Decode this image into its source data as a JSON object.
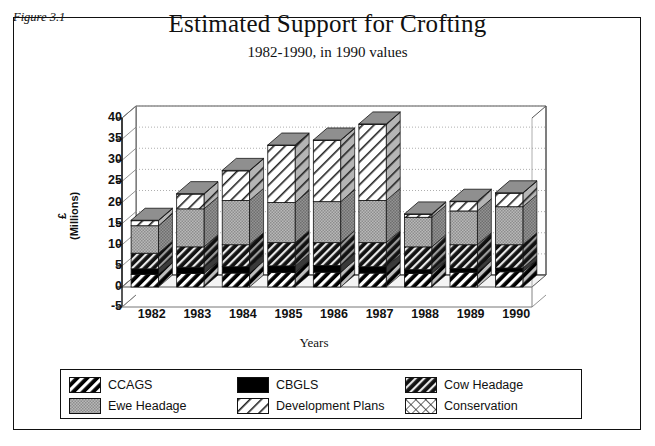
{
  "figure": {
    "label": "Figure 3.1",
    "title": "Estimated Support for Crofting",
    "subtitle": "1982-1990, in 1990 values"
  },
  "chart_data": {
    "type": "bar",
    "stacked": true,
    "three_d": true,
    "title": "Estimated Support for Crofting",
    "subtitle": "1982-1990, in 1990 values",
    "xlabel": "Years",
    "ylabel": "£\n(Millions)",
    "ylabel_line1": "£",
    "ylabel_line2": "(Millions)",
    "categories": [
      "1982",
      "1983",
      "1984",
      "1985",
      "1986",
      "1987",
      "1988",
      "1989",
      "1990"
    ],
    "ylim": [
      -5,
      40
    ],
    "yticks": [
      40,
      35,
      30,
      25,
      20,
      15,
      10,
      5,
      0,
      -5
    ],
    "grid": true,
    "legend_position": "bottom",
    "series": [
      {
        "name": "CCAGS",
        "pattern": "black-diagonal-stripes",
        "values": [
          3.0,
          3.2,
          3.3,
          3.4,
          3.5,
          3.3,
          3.2,
          3.5,
          3.6
        ]
      },
      {
        "name": "CBGLS",
        "pattern": "solid-black",
        "values": [
          1.3,
          1.5,
          1.5,
          1.6,
          1.6,
          1.5,
          0.9,
          0.9,
          0.9
        ]
      },
      {
        "name": "Cow Headage",
        "pattern": "dark-diagonal-stripes",
        "values": [
          3.7,
          4.8,
          5.2,
          5.5,
          5.4,
          5.7,
          5.4,
          5.6,
          5.5
        ]
      },
      {
        "name": "Ewe Headage",
        "pattern": "gray-stipple",
        "values": [
          6.5,
          9.0,
          10.5,
          9.5,
          9.7,
          10.0,
          7.0,
          8.0,
          9.0
        ]
      },
      {
        "name": "Development Plans",
        "pattern": "white-diagonal-stripes",
        "values": [
          1.2,
          3.5,
          7.0,
          13.5,
          14.5,
          18.0,
          0.7,
          2.2,
          3.2
        ]
      },
      {
        "name": "Conservation",
        "pattern": "white-crosshatch",
        "values": [
          0.1,
          0.1,
          0.1,
          0.1,
          0.1,
          0.1,
          0.1,
          0.1,
          0.1
        ]
      }
    ],
    "totals": [
      15.8,
      22.1,
      27.6,
      33.6,
      34.8,
      38.6,
      17.3,
      20.3,
      22.3
    ]
  },
  "legend": {
    "items": [
      {
        "label": "CCAGS"
      },
      {
        "label": "CBGLS"
      },
      {
        "label": "Cow Headage"
      },
      {
        "label": "Ewe Headage"
      },
      {
        "label": "Development Plans"
      },
      {
        "label": "Conservation"
      }
    ]
  }
}
